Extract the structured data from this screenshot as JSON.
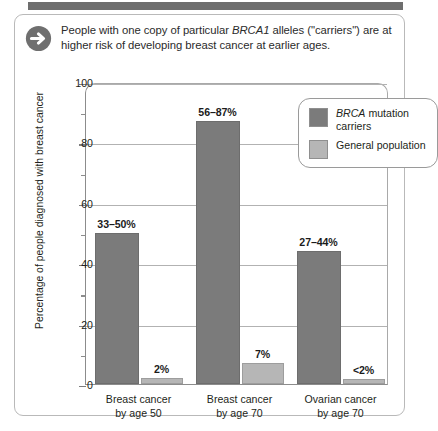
{
  "caption": {
    "icon": "arrow-right-circle-icon",
    "text_before": "People with one copy of particular ",
    "italic_term": "BRCA1",
    "text_after": " alleles (\"carriers\") are at higher risk of developing breast cancer at earlier ages."
  },
  "legend": {
    "entries": [
      {
        "swatch": "dark",
        "italic": "BRCA",
        "rest": " mutation carriers",
        "color": "#7b7b7b"
      },
      {
        "swatch": "light",
        "italic": "",
        "rest": "General population",
        "color": "#b6b6b6"
      }
    ]
  },
  "chart_data": {
    "type": "bar",
    "title": "",
    "xlabel": "",
    "ylabel": "Percentage of people diagnosed with breast cancer",
    "ylim": [
      0,
      100
    ],
    "ytick_labels": [
      "0",
      "20",
      "40",
      "60",
      "80",
      "100"
    ],
    "yticks": [
      0,
      20,
      40,
      60,
      80,
      100
    ],
    "yminor_ticks": [
      10,
      30,
      50,
      70,
      90
    ],
    "grid": true,
    "legend_position": "top-right",
    "categories": [
      "Breast cancer by age 50",
      "Breast cancer by age 70",
      "Ovarian cancer by age 70"
    ],
    "category_lines": [
      [
        "Breast cancer",
        "by age 50"
      ],
      [
        "Breast cancer",
        "by age 70"
      ],
      [
        "Ovarian cancer",
        "by age 70"
      ]
    ],
    "series": [
      {
        "name": "BRCA mutation carriers",
        "color": "#7b7b7b",
        "values": [
          50,
          87,
          44
        ],
        "range_low": [
          33,
          56,
          27
        ],
        "range_high": [
          50,
          87,
          44
        ],
        "data_labels": [
          "33–50%",
          "56–87%",
          "27–44%"
        ]
      },
      {
        "name": "General population",
        "color": "#b6b6b6",
        "values": [
          2,
          7,
          1.5
        ],
        "data_labels": [
          "2%",
          "7%",
          "<2%"
        ]
      }
    ]
  }
}
